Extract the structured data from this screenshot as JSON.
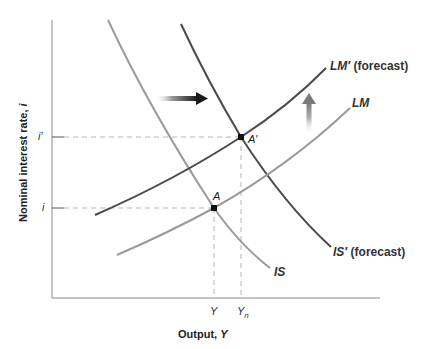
{
  "axes": {
    "x_title": "Output,",
    "x_var": "Y",
    "y_title": "Nominal interest rate,",
    "y_var": "i",
    "y_ticks": [
      {
        "label": "i′",
        "level": "high"
      },
      {
        "label": "i",
        "level": "low"
      }
    ],
    "x_ticks": [
      {
        "label": "Y",
        "sub": ""
      },
      {
        "label": "Y",
        "sub": "n"
      }
    ]
  },
  "curves": {
    "is": {
      "name": "IS",
      "suffix": "",
      "color": "#9a9a9a"
    },
    "is_prime": {
      "name": "IS′",
      "suffix": " (forecast)",
      "color": "#4a4a4a"
    },
    "lm": {
      "name": "LM",
      "suffix": "",
      "color": "#9a9a9a"
    },
    "lm_prime": {
      "name": "LM′",
      "suffix": " (forecast)",
      "color": "#4a4a4a"
    }
  },
  "points": {
    "a": {
      "label": "A"
    },
    "a_prime": {
      "label": "A′"
    }
  },
  "arrows": {
    "is_shift": {
      "direction": "right"
    },
    "lm_shift": {
      "direction": "up"
    }
  },
  "colors": {
    "axis": "#b0b0b0",
    "dashed": "#b5b5b5",
    "dark_curve": "#4a4a4a",
    "light_curve": "#9a9a9a",
    "point": "#111111"
  }
}
